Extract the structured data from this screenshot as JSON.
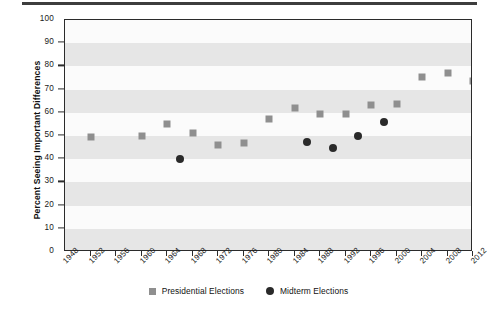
{
  "chart_data": {
    "type": "scatter",
    "title": "",
    "xlabel": "",
    "ylabel": "Percent Seeing Important Differences",
    "xlim": [
      1948,
      2012
    ],
    "ylim": [
      0,
      100
    ],
    "ytick_labels": [
      "0",
      "10",
      "20",
      "30",
      "40",
      "50",
      "60",
      "70",
      "80",
      "90",
      "100"
    ],
    "ytick_values": [
      0,
      10,
      20,
      30,
      40,
      50,
      60,
      70,
      80,
      90,
      100
    ],
    "xtick_labels": [
      "1948",
      "1952",
      "1956",
      "1960",
      "1964",
      "1968",
      "1972",
      "1976",
      "1980",
      "1984",
      "1988",
      "1992",
      "1996",
      "2000",
      "2004",
      "2008",
      "2012"
    ],
    "xtick_values": [
      1948,
      1952,
      1956,
      1960,
      1964,
      1968,
      1972,
      1976,
      1980,
      1984,
      1988,
      1992,
      1996,
      2000,
      2004,
      2008,
      2012
    ],
    "grid": false,
    "banded_background": true,
    "legend_position": "bottom-center",
    "series": [
      {
        "name": "Presidential Elections",
        "marker": "square",
        "color": "#8f8f8f",
        "points": [
          {
            "x": 1952,
            "y": 49.5
          },
          {
            "x": 1960,
            "y": 50.0
          },
          {
            "x": 1964,
            "y": 55.0
          },
          {
            "x": 1968,
            "y": 51.5
          },
          {
            "x": 1972,
            "y": 46.0
          },
          {
            "x": 1976,
            "y": 47.0
          },
          {
            "x": 1980,
            "y": 57.5
          },
          {
            "x": 1984,
            "y": 62.0
          },
          {
            "x": 1988,
            "y": 59.5
          },
          {
            "x": 1992,
            "y": 59.5
          },
          {
            "x": 1996,
            "y": 63.5
          },
          {
            "x": 2000,
            "y": 64.0
          },
          {
            "x": 2004,
            "y": 75.5
          },
          {
            "x": 2008,
            "y": 77.0
          },
          {
            "x": 2012,
            "y": 73.5
          }
        ]
      },
      {
        "name": "Midterm Elections",
        "marker": "circle",
        "color": "#2a2a2a",
        "points": [
          {
            "x": 1966,
            "y": 40.0
          },
          {
            "x": 1986,
            "y": 47.5
          },
          {
            "x": 1990,
            "y": 45.0
          },
          {
            "x": 1994,
            "y": 50.0
          },
          {
            "x": 1998,
            "y": 56.0
          }
        ]
      }
    ]
  },
  "legend": {
    "items": [
      {
        "label": "Presidential Elections",
        "marker": "square"
      },
      {
        "label": "Midterm Elections",
        "marker": "circle"
      }
    ]
  },
  "colors": {
    "presidential": "#8f8f8f",
    "midterm": "#2a2a2a",
    "axis": "#2b2b2b",
    "band": "#e6e6e6",
    "plot_background": "#fbfbfb"
  }
}
